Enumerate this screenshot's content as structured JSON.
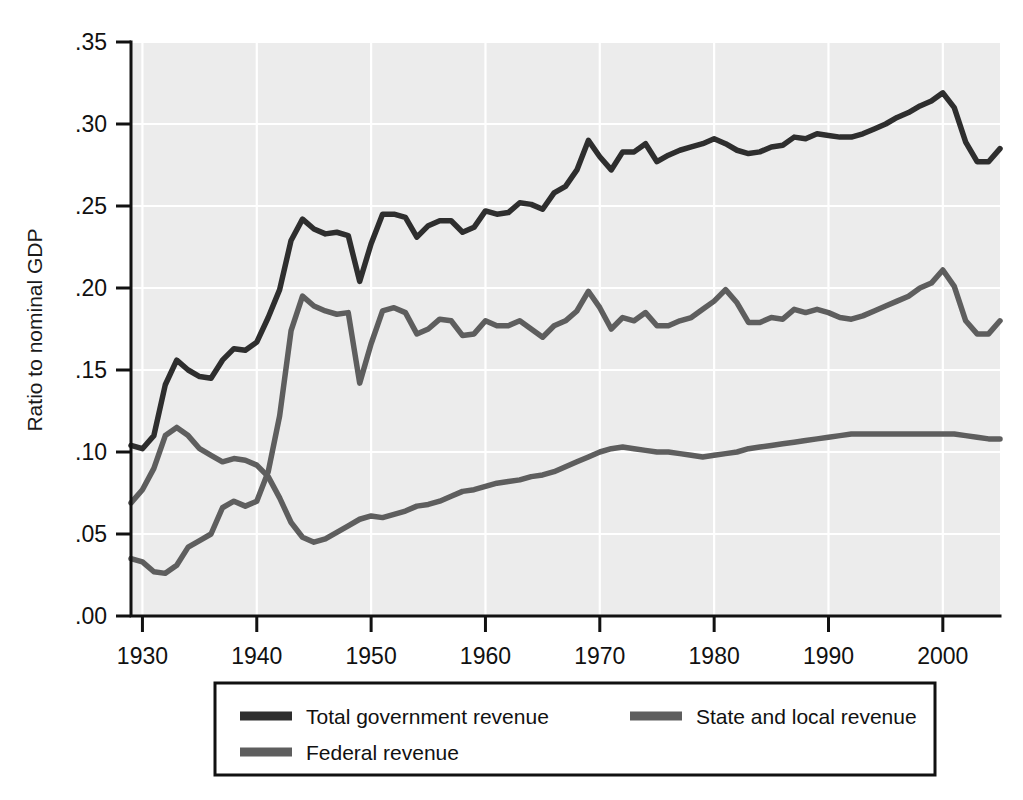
{
  "chart_data": {
    "type": "line",
    "title": "",
    "subtitle": "",
    "xlabel": "",
    "ylabel": "Ratio to nominal GDP",
    "xlim": [
      1929,
      2005
    ],
    "ylim": [
      0.0,
      0.35
    ],
    "xticks": [
      1930,
      1940,
      1950,
      1960,
      1970,
      1980,
      1990,
      2000
    ],
    "xticklabels": [
      "1930",
      "1940",
      "1950",
      "1960",
      "1970",
      "1980",
      "1990",
      "2000"
    ],
    "yticks": [
      0.0,
      0.05,
      0.1,
      0.15,
      0.2,
      0.25,
      0.3,
      0.35
    ],
    "yticklabels": [
      ".00",
      ".05",
      ".10",
      ".15",
      ".20",
      ".25",
      ".30",
      ".35"
    ],
    "grid": "horizontal-and-vertical-white-on-gray",
    "legend_position": "below-axes",
    "x": [
      1929,
      1930,
      1931,
      1932,
      1933,
      1934,
      1935,
      1936,
      1937,
      1938,
      1939,
      1940,
      1941,
      1942,
      1943,
      1944,
      1945,
      1946,
      1947,
      1948,
      1949,
      1950,
      1951,
      1952,
      1953,
      1954,
      1955,
      1956,
      1957,
      1958,
      1959,
      1960,
      1961,
      1962,
      1963,
      1964,
      1965,
      1966,
      1967,
      1968,
      1969,
      1970,
      1971,
      1972,
      1973,
      1974,
      1975,
      1976,
      1977,
      1978,
      1979,
      1980,
      1981,
      1982,
      1983,
      1984,
      1985,
      1986,
      1987,
      1988,
      1989,
      1990,
      1991,
      1992,
      1993,
      1994,
      1995,
      1996,
      1997,
      1998,
      1999,
      2000,
      2001,
      2002,
      2003,
      2004,
      2005
    ],
    "series": [
      {
        "name": "Total government revenue",
        "color": "#2e2e2e",
        "width": 5.5,
        "values": [
          0.104,
          0.102,
          0.11,
          0.141,
          0.156,
          0.15,
          0.146,
          0.145,
          0.156,
          0.163,
          0.162,
          0.167,
          0.182,
          0.199,
          0.229,
          0.242,
          0.236,
          0.233,
          0.234,
          0.232,
          0.204,
          0.227,
          0.245,
          0.245,
          0.243,
          0.231,
          0.238,
          0.241,
          0.241,
          0.234,
          0.237,
          0.247,
          0.245,
          0.246,
          0.252,
          0.251,
          0.248,
          0.258,
          0.262,
          0.272,
          0.29,
          0.28,
          0.272,
          0.283,
          0.283,
          0.288,
          0.277,
          0.281,
          0.284,
          0.286,
          0.288,
          0.291,
          0.288,
          0.284,
          0.282,
          0.283,
          0.286,
          0.287,
          0.292,
          0.291,
          0.294,
          0.293,
          0.292,
          0.292,
          0.294,
          0.297,
          0.3,
          0.304,
          0.307,
          0.311,
          0.314,
          0.319,
          0.31,
          0.289,
          0.277,
          0.277,
          0.285
        ]
      },
      {
        "name": "Federal revenue",
        "color": "#5e5e5e",
        "width": 5.5,
        "values": [
          0.035,
          0.033,
          0.027,
          0.026,
          0.031,
          0.042,
          0.046,
          0.05,
          0.066,
          0.07,
          0.067,
          0.07,
          0.088,
          0.122,
          0.174,
          0.195,
          0.189,
          0.186,
          0.184,
          0.185,
          0.142,
          0.166,
          0.186,
          0.188,
          0.185,
          0.172,
          0.175,
          0.181,
          0.18,
          0.171,
          0.172,
          0.18,
          0.177,
          0.177,
          0.18,
          0.175,
          0.17,
          0.177,
          0.18,
          0.186,
          0.198,
          0.188,
          0.175,
          0.182,
          0.18,
          0.185,
          0.177,
          0.177,
          0.18,
          0.182,
          0.187,
          0.192,
          0.199,
          0.191,
          0.179,
          0.179,
          0.182,
          0.181,
          0.187,
          0.185,
          0.187,
          0.185,
          0.182,
          0.181,
          0.183,
          0.186,
          0.189,
          0.192,
          0.195,
          0.2,
          0.203,
          0.211,
          0.201,
          0.18,
          0.172,
          0.172,
          0.18
        ]
      },
      {
        "name": "State and local revenue",
        "color": "#5e5e5e",
        "width": 5.5,
        "values": [
          0.069,
          0.077,
          0.09,
          0.11,
          0.115,
          0.11,
          0.102,
          0.098,
          0.094,
          0.096,
          0.095,
          0.092,
          0.085,
          0.072,
          0.057,
          0.048,
          0.045,
          0.047,
          0.051,
          0.055,
          0.059,
          0.061,
          0.06,
          0.062,
          0.064,
          0.067,
          0.068,
          0.07,
          0.073,
          0.076,
          0.077,
          0.079,
          0.081,
          0.082,
          0.083,
          0.085,
          0.086,
          0.088,
          0.091,
          0.094,
          0.097,
          0.1,
          0.102,
          0.103,
          0.102,
          0.101,
          0.1,
          0.1,
          0.099,
          0.098,
          0.097,
          0.098,
          0.099,
          0.1,
          0.102,
          0.103,
          0.104,
          0.105,
          0.106,
          0.107,
          0.108,
          0.109,
          0.11,
          0.111,
          0.111,
          0.111,
          0.111,
          0.111,
          0.111,
          0.111,
          0.111,
          0.111,
          0.111,
          0.11,
          0.109,
          0.108,
          0.108
        ]
      }
    ],
    "legend": [
      {
        "label": "Total government revenue",
        "color": "#2e2e2e"
      },
      {
        "label": "State and local revenue",
        "color": "#5e5e5e"
      },
      {
        "label": "Federal revenue",
        "color": "#5e5e5e"
      }
    ]
  }
}
